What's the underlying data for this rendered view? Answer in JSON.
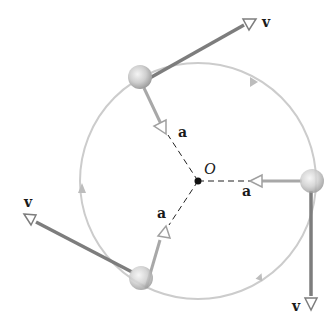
{
  "diagram": {
    "center": {
      "label": "O",
      "x": 198,
      "y": 181
    },
    "circle": {
      "radius": 118,
      "color": "#c8c8c8",
      "direction": "clockwise"
    },
    "colors": {
      "velocity": "#808080",
      "acceleration": "#a8a8a8",
      "dash": "#222222",
      "ball": "#d4d4d4"
    },
    "particles": [
      {
        "name": "top",
        "x": 140,
        "y": 78,
        "v_label": "v",
        "a_label": "a"
      },
      {
        "name": "right",
        "x": 312,
        "y": 181,
        "v_label": "v",
        "a_label": "a"
      },
      {
        "name": "bottom",
        "x": 141,
        "y": 298,
        "v_label": "v",
        "a_label": "a"
      }
    ],
    "labels": {
      "v_top": "v",
      "v_right": "v",
      "v_left": "v",
      "a_top": "a",
      "a_right": "a",
      "a_bottom": "a",
      "origin": "O"
    }
  }
}
